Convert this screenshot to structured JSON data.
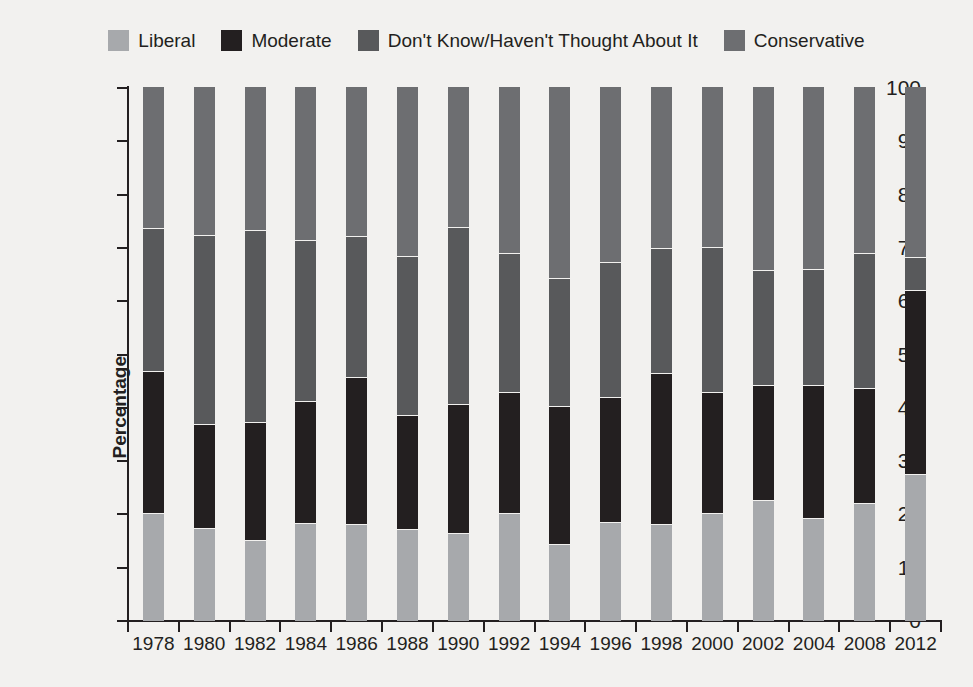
{
  "chart_data": {
    "type": "bar",
    "stacked": true,
    "title": "",
    "xlabel": "",
    "ylabel": "Percentage",
    "ylim": [
      0,
      100
    ],
    "yticks": [
      0,
      10,
      20,
      30,
      40,
      50,
      60,
      70,
      80,
      90,
      100
    ],
    "grid": false,
    "legend_position": "top-center",
    "categories": [
      "1978",
      "1980",
      "1982",
      "1984",
      "1986",
      "1988",
      "1990",
      "1992",
      "1994",
      "1996",
      "1998",
      "2000",
      "2002",
      "2004",
      "2008",
      "2012"
    ],
    "series": [
      {
        "name": "Liberal",
        "color": "#a7a9ac",
        "values": [
          20.1,
          17.2,
          15.0,
          18.2,
          18.1,
          17.0,
          16.3,
          20.0,
          14.3,
          18.3,
          18.1,
          20.0,
          22.6,
          19.2,
          22.0,
          27.4
        ]
      },
      {
        "name": "Moderate",
        "color": "#231f20",
        "values": [
          26.6,
          19.6,
          22.1,
          22.8,
          27.5,
          21.5,
          24.2,
          22.7,
          25.9,
          23.6,
          28.3,
          22.8,
          21.4,
          24.8,
          21.5,
          34.5
        ]
      },
      {
        "name": "Don't Know/Haven't Thought About It",
        "color": "#58595b",
        "values": [
          26.8,
          35.5,
          36.0,
          30.3,
          26.5,
          29.8,
          33.2,
          26.1,
          23.9,
          25.3,
          23.4,
          27.1,
          21.7,
          21.8,
          25.3,
          6.3
        ]
      },
      {
        "name": "Conservative",
        "color": "#6d6e71",
        "values": [
          26.5,
          27.7,
          26.9,
          28.7,
          27.9,
          31.7,
          26.3,
          31.2,
          35.9,
          32.8,
          30.2,
          30.1,
          34.3,
          34.2,
          31.2,
          31.8
        ]
      }
    ]
  },
  "legend": {
    "items": [
      {
        "label": "Liberal",
        "color": "#a7a9ac"
      },
      {
        "label": "Moderate",
        "color": "#231f20"
      },
      {
        "label": "Don't Know/Haven't Thought About It",
        "color": "#58595b"
      },
      {
        "label": "Conservative",
        "color": "#6d6e71"
      }
    ]
  },
  "axes": {
    "y_label": "Percentage"
  }
}
